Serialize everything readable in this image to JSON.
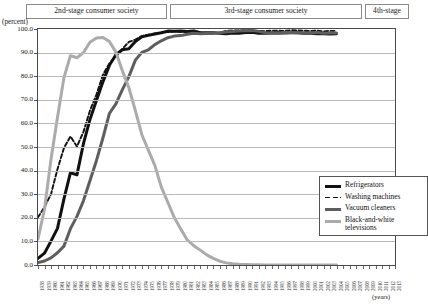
{
  "stages": {
    "stage2": "2nd-stage consumer society",
    "stage3": "3rd-stage consumer society",
    "stage4": "4th-stage"
  },
  "axes": {
    "y_unit": "(percent)",
    "x_unit": "(years)",
    "y_ticks": [
      "100.0",
      "90.0",
      "80.0",
      "70.0",
      "60.0",
      "50.0",
      "40.0",
      "30.0",
      "20.0",
      "10.0",
      "0.0"
    ],
    "ylim": [
      0,
      100
    ],
    "x_ticks": [
      "1958",
      "1959",
      "1960",
      "1961",
      "1962",
      "1963",
      "1964",
      "1965",
      "1966",
      "1967",
      "1968",
      "1969",
      "1970",
      "1971",
      "1972",
      "1973",
      "1974",
      "1975",
      "1976",
      "1977",
      "1978",
      "1979",
      "1980",
      "1981",
      "1982",
      "1983",
      "1984",
      "1985",
      "1986",
      "1987",
      "1988",
      "1989",
      "1990",
      "1991",
      "1992",
      "1993",
      "1994",
      "1995",
      "1996",
      "1997",
      "1998",
      "1999",
      "2000",
      "2001",
      "2002",
      "2003",
      "2004",
      "2005",
      "2006",
      "2007",
      "2008",
      "2009",
      "2010",
      "2011",
      "2012",
      "2013"
    ]
  },
  "legend": {
    "position": "inside-right",
    "items": [
      {
        "label": "Refrigerators",
        "color": "#111111",
        "style": "solid",
        "width": 3.1
      },
      {
        "label": "Washing machines",
        "color": "#111111",
        "style": "dashed",
        "width": 1.9
      },
      {
        "label": "Vacuum cleaners",
        "color": "#5e5e5e",
        "style": "solid",
        "width": 3.1
      },
      {
        "label": "Black-and-white televisions",
        "color": "#ababab",
        "style": "solid",
        "width": 3.1
      }
    ]
  },
  "chart_data": {
    "type": "line",
    "title": "",
    "xlabel": "(years)",
    "ylabel": "(percent)",
    "ylim": [
      0,
      100
    ],
    "grid": true,
    "x": [
      1958,
      1959,
      1960,
      1961,
      1962,
      1963,
      1964,
      1965,
      1966,
      1967,
      1968,
      1969,
      1970,
      1971,
      1972,
      1973,
      1974,
      1975,
      1976,
      1977,
      1978,
      1979,
      1980,
      1981,
      1982,
      1983,
      1984,
      1985,
      1986,
      1987,
      1988,
      1989,
      1990,
      1991,
      1992,
      1993,
      1994,
      1995,
      1996,
      1997,
      1998,
      1999,
      2000,
      2001,
      2002,
      2003,
      2004
    ],
    "series": [
      {
        "name": "Refrigerators",
        "color": "#111111",
        "style": "solid",
        "values": [
          2.8,
          5.0,
          10.1,
          15.5,
          28.0,
          39.1,
          38.2,
          51.4,
          61.6,
          69.7,
          77.6,
          84.6,
          89.1,
          91.2,
          91.6,
          94.7,
          96.7,
          97.3,
          97.9,
          98.4,
          99.1,
          99.0,
          99.1,
          98.9,
          99.2,
          98.4,
          98.4,
          98.4,
          98.2,
          98.0,
          98.3,
          98.2,
          98.5,
          98.6,
          98.2,
          98.2,
          98.3,
          98.4,
          98.3,
          98.4,
          98.4,
          98.2,
          98.2,
          98.0,
          98.0,
          97.9,
          98.0
        ]
      },
      {
        "name": "Washing machines",
        "color": "#111111",
        "style": "dashed",
        "values": [
          20.2,
          24.6,
          30.0,
          40.6,
          49.6,
          54.5,
          50.2,
          56.4,
          65.4,
          72.2,
          80.6,
          85.4,
          88.4,
          91.6,
          94.5,
          95.5,
          97.0,
          97.6,
          98.1,
          98.4,
          98.7,
          99.0,
          98.8,
          98.8,
          99.1,
          98.4,
          98.2,
          98.1,
          98.4,
          99.2,
          99.4,
          99.4,
          99.5,
          99.3,
          99.2,
          99.1,
          99.3,
          99.3,
          99.2,
          99.5,
          99.4,
          99.3,
          99.2,
          99.3,
          99.0,
          99.2,
          99.2
        ]
      },
      {
        "name": "Vacuum cleaners",
        "color": "#5e5e5e",
        "style": "solid",
        "values": [
          1.0,
          1.7,
          3.0,
          5.2,
          8.0,
          15.4,
          20.6,
          27.2,
          35.7,
          44.2,
          53.8,
          64.2,
          68.3,
          74.3,
          79.8,
          86.8,
          90.1,
          91.2,
          93.4,
          95.0,
          96.3,
          97.0,
          97.2,
          97.8,
          98.2,
          98.0,
          98.1,
          98.2,
          98.4,
          98.7,
          98.9,
          99.1,
          99.3,
          99.4,
          99.0,
          98.4,
          98.3,
          98.2,
          98.6,
          98.5,
          98.4,
          98.3,
          98.2,
          98.5,
          98.2,
          98.3,
          98.3
        ]
      },
      {
        "name": "Black-and-white televisions",
        "color": "#ababab",
        "style": "solid",
        "values": [
          11.0,
          23.6,
          44.7,
          62.5,
          79.4,
          88.7,
          87.8,
          90.0,
          94.4,
          96.2,
          96.4,
          94.7,
          90.2,
          82.3,
          75.1,
          65.4,
          55.2,
          48.7,
          42.2,
          33.0,
          26.6,
          20.1,
          15.2,
          10.6,
          8.2,
          6.3,
          4.3,
          2.8,
          1.6,
          0.9,
          0.5,
          0.3,
          0.2,
          0.1,
          0.1,
          0.0,
          0.0,
          0.0,
          0.0,
          0.0,
          0.0,
          0.0,
          0.0,
          0.0,
          0.0,
          0.0,
          0.0
        ]
      }
    ]
  }
}
